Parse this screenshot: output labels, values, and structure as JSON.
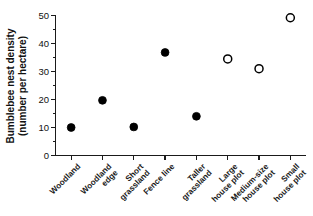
{
  "chart_data": {
    "type": "scatter",
    "title": "",
    "subtitle": "",
    "xlabel": "",
    "ylabel": "Bumblebee nest density (number per hectare)",
    "ylabel_line1": "Bumblebee nest density",
    "ylabel_line2": "(number per hectare)",
    "ylim": [
      0,
      50
    ],
    "ytick_values": [
      0,
      10,
      20,
      30,
      40,
      50
    ],
    "ytick_labels": [
      "0",
      "10",
      "20",
      "30",
      "40",
      "50"
    ],
    "yminor_values": [
      5,
      15,
      25,
      35,
      45
    ],
    "grid": false,
    "legend": null,
    "categories": [
      "Woodland",
      "Woodland edge",
      "Short grassland",
      "Fence line",
      "Taller grassland",
      "Large house plot",
      "Medium-size house plot",
      "Small house plot"
    ],
    "category_lines": [
      [
        "Woodland",
        ""
      ],
      [
        "Woodland",
        "edge"
      ],
      [
        "Short",
        "grassland"
      ],
      [
        "Fence line",
        ""
      ],
      [
        "Taller",
        "grassland"
      ],
      [
        "Large",
        "house plot"
      ],
      [
        "Medium-size",
        "house plot"
      ],
      [
        "Small",
        "house plot"
      ]
    ],
    "values": [
      10.0,
      19.7,
      10.2,
      36.8,
      14.0,
      34.5,
      31.0,
      49.2
    ],
    "marker_styles": [
      "filled",
      "filled",
      "filled",
      "filled",
      "filled",
      "open",
      "open",
      "open"
    ],
    "marker_color": "#000000",
    "marker_open_fill": "#ffffff",
    "axis_color": "#1a1a1a",
    "background_color": "#ffffff",
    "points": [
      {
        "category": "Woodland",
        "value": 10.0,
        "marker": "filled"
      },
      {
        "category": "Woodland edge",
        "value": 19.7,
        "marker": "filled"
      },
      {
        "category": "Short grassland",
        "value": 10.2,
        "marker": "filled"
      },
      {
        "category": "Fence line",
        "value": 36.8,
        "marker": "filled"
      },
      {
        "category": "Taller grassland",
        "value": 14.0,
        "marker": "filled"
      },
      {
        "category": "Large house plot",
        "value": 34.5,
        "marker": "open"
      },
      {
        "category": "Medium-size house plot",
        "value": 31.0,
        "marker": "open"
      },
      {
        "category": "Small house plot",
        "value": 49.2,
        "marker": "open"
      }
    ]
  }
}
